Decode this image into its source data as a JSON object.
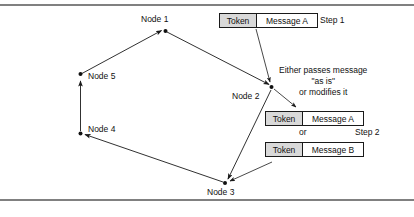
{
  "figure": {
    "background_color": "#ffffff",
    "line_color": "#1a1a1a",
    "rule_color": "#808080",
    "token_cell_fill": "#d9d9d9"
  },
  "nodes": [
    {
      "id": "node1",
      "label": "Node 1"
    },
    {
      "id": "node2",
      "label": "Node 2"
    },
    {
      "id": "node3",
      "label": "Node 3"
    },
    {
      "id": "node4",
      "label": "Node 4"
    },
    {
      "id": "node5",
      "label": "Node 5"
    }
  ],
  "frames": {
    "step1": {
      "token_label": "Token",
      "message_label": "Message A",
      "step_label": "Step 1"
    },
    "step2_option_a": {
      "token_label": "Token",
      "message_label": "Message A"
    },
    "step2_option_b": {
      "token_label": "Token",
      "message_label": "Message B"
    },
    "or_label": "or",
    "step2_label": "Step 2"
  },
  "annotation": {
    "line1": "Either passes message",
    "line2": "\"as is\"",
    "line3": "or modifies it"
  }
}
